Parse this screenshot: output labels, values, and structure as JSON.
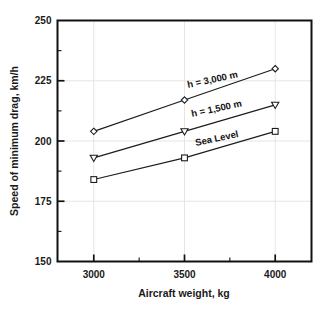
{
  "chart_data": {
    "type": "line",
    "title": "",
    "xlabel": "Aircraft weight, kg",
    "ylabel": "Speed of minimum drag, km/h",
    "xlim": [
      2800,
      4200
    ],
    "ylim": [
      150,
      250
    ],
    "x": [
      3000,
      3500,
      4000
    ],
    "xticks": [
      3000,
      3500,
      4000
    ],
    "xtick_labels": [
      "3000",
      "3500",
      "4000"
    ],
    "xticks_minor": [
      3250,
      3750
    ],
    "yticks": [
      150,
      175,
      200,
      225,
      250
    ],
    "ytick_labels": [
      "150",
      "175",
      "200",
      "225",
      "250"
    ],
    "yticks_minor": [
      162.5,
      187.5,
      212.5,
      237.5
    ],
    "grid": true,
    "legend_position": "inline-annotation",
    "series": [
      {
        "name": "h = 3,000 m",
        "marker": "diamond",
        "values": [
          204,
          217,
          230
        ],
        "annotation": "h = 3,000 m"
      },
      {
        "name": "h = 1,500 m",
        "marker": "triangle-down",
        "values": [
          193,
          204,
          215
        ],
        "annotation": "h = 1,500 m"
      },
      {
        "name": "Sea Level",
        "marker": "square",
        "values": [
          184,
          193,
          204
        ],
        "annotation": "Sea Level"
      }
    ]
  },
  "axes": {
    "x_title": "Aircraft weight, kg",
    "y_title": "Speed of minimum drag, km/h",
    "x_tick_labels": [
      "3000",
      "3500",
      "4000"
    ],
    "y_tick_labels": [
      "250",
      "225",
      "200",
      "175",
      "150"
    ]
  },
  "annotations": {
    "upper": "h = 3,000 m",
    "middle": "h = 1,500 m",
    "lower": "Sea Level"
  },
  "colors": {
    "background": "#ffffff",
    "frame": "#111111",
    "line": "#1c1c1c",
    "grid": "#e2e2e2",
    "text": "#1a1a1a"
  }
}
